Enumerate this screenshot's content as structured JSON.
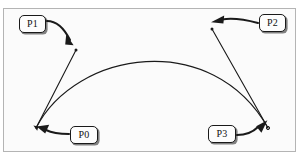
{
  "figure": {
    "type": "bezier-curve-diagram",
    "background_color": "#ffffff",
    "frame": {
      "x": 3,
      "y": 8,
      "width": 293,
      "height": 144,
      "border_color": "#b4b4b4",
      "fill_color": "#fbfbfb"
    },
    "stroke_color": "#1a1a1a"
  },
  "points": [
    {
      "id": "P0",
      "label": "P0",
      "role": "start-anchor-point",
      "x": 36,
      "y": 128,
      "label_box": {
        "x": 70,
        "y": 126,
        "width": 28,
        "height": 18
      }
    },
    {
      "id": "P1",
      "label": "P1",
      "role": "first-control-point",
      "x": 76,
      "y": 50,
      "label_box": {
        "x": 19,
        "y": 15,
        "width": 27,
        "height": 18
      }
    },
    {
      "id": "P2",
      "label": "P2",
      "role": "second-control-point",
      "x": 212,
      "y": 29,
      "label_box": {
        "x": 259,
        "y": 14,
        "width": 27,
        "height": 18
      }
    },
    {
      "id": "P3",
      "label": "P3",
      "role": "end-anchor-point",
      "x": 268,
      "y": 128,
      "label_box": {
        "x": 208,
        "y": 125,
        "width": 28,
        "height": 18
      }
    }
  ],
  "curve": {
    "name": "cubic-bezier-curve",
    "start": {
      "x": 36,
      "y": 128
    },
    "control1": {
      "x": 76,
      "y": 50
    },
    "control2": {
      "x": 212,
      "y": 29
    },
    "end": {
      "x": 268,
      "y": 128
    },
    "stroke_color": "#1a1a1a",
    "stroke_width": 1
  },
  "handles": [
    {
      "name": "handle-p0-p1",
      "from": "P0",
      "to": "P1",
      "stroke_color": "#1a1a1a",
      "stroke_width": 1
    },
    {
      "name": "handle-p3-p2",
      "from": "P3",
      "to": "P2",
      "stroke_color": "#1a1a1a",
      "stroke_width": 1
    }
  ],
  "callout_arrows": [
    {
      "name": "callout-arrow-p1",
      "from_label": "P1",
      "to_point": "P1",
      "direction": "down-right"
    },
    {
      "name": "callout-arrow-p2",
      "from_label": "P2",
      "to_point": "P2",
      "direction": "left"
    },
    {
      "name": "callout-arrow-p0",
      "from_label": "P0",
      "to_point": "P0",
      "direction": "left"
    },
    {
      "name": "callout-arrow-p3",
      "from_label": "P3",
      "to_point": "P3",
      "direction": "up-right"
    }
  ]
}
